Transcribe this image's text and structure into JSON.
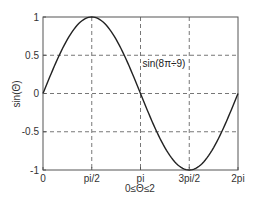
{
  "chart_data": {
    "type": "line",
    "title": "",
    "xlabel": "0≤Θ≤2",
    "ylabel": "sin(Θ)",
    "x_ticks": [
      "0",
      "pi/2",
      "pi",
      "3pi/2",
      "2pi"
    ],
    "x_tick_values": [
      0,
      1.5708,
      3.1416,
      4.7124,
      6.2832
    ],
    "y_ticks": [
      "-1",
      "-0.5",
      "0",
      "0.5",
      "1"
    ],
    "y_tick_values": [
      -1,
      -0.5,
      0,
      0.5,
      1
    ],
    "xlim": [
      0,
      6.2832
    ],
    "ylim": [
      -1,
      1
    ],
    "grid": true,
    "grid_style": "dashed",
    "annotation": {
      "text": "sin(8π÷9)",
      "x": 3.1416,
      "y": 0.4
    },
    "series": [
      {
        "name": "sin(Θ)",
        "x": [
          0,
          0.7854,
          1.5708,
          2.3562,
          3.1416,
          3.927,
          4.7124,
          5.4978,
          6.2832
        ],
        "values": [
          0,
          0.7071,
          1,
          0.7071,
          0,
          -0.7071,
          -1,
          -0.7071,
          0
        ],
        "color": "#222222"
      }
    ]
  }
}
